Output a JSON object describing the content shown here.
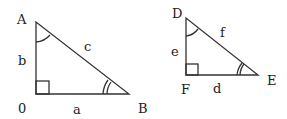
{
  "diagram": {
    "triangle1": {
      "vertices": {
        "top": "A",
        "right_angle": "0",
        "right": "B"
      },
      "sides": {
        "vertical": "b",
        "hypotenuse": "c",
        "horizontal": "a"
      },
      "angle_marks": {
        "top": "single-arc",
        "right": "double-arc",
        "right_angle": "square"
      }
    },
    "triangle2": {
      "vertices": {
        "top": "D",
        "right_angle": "F",
        "right": "E"
      },
      "sides": {
        "vertical": "e",
        "hypotenuse": "f",
        "horizontal": "d"
      },
      "angle_marks": {
        "top": "single-arc",
        "right": "double-arc",
        "right_angle": "square"
      }
    },
    "colors": {
      "stroke": "#333333",
      "text": "#222222",
      "background": "#ffffff"
    }
  }
}
